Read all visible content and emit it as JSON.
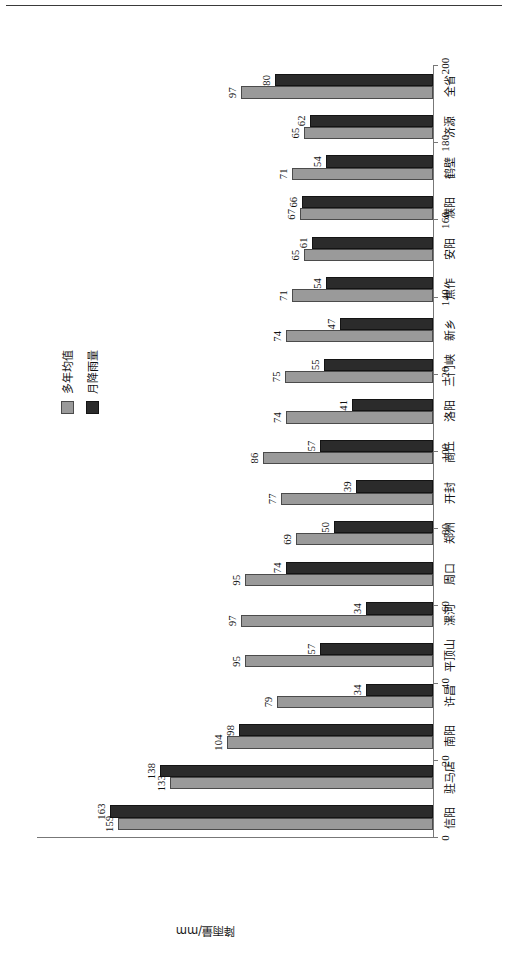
{
  "figure": {
    "y_axis_title": "降雨量/mm",
    "legend": {
      "position": "top-right-inside",
      "items": [
        {
          "label": "多年均值",
          "color": "#9a9a9a"
        },
        {
          "label": "月降雨量",
          "color": "#2b2b2b"
        }
      ]
    }
  },
  "chart_data": {
    "type": "bar",
    "title": "",
    "subtitle": "",
    "xlabel": "",
    "ylabel": "降雨量/mm",
    "ylim": [
      0,
      200
    ],
    "yticks": [
      0,
      20,
      40,
      60,
      80,
      100,
      120,
      140,
      160,
      180,
      200
    ],
    "ytick_labels": [
      "0",
      "20",
      "40",
      "60",
      "80",
      "100",
      "120",
      "140",
      "160",
      "180",
      "200"
    ],
    "grid": false,
    "orientation": "vertical-bars-rotated-90",
    "legend_position": "upper right",
    "categories": [
      "信阳",
      "驻马店",
      "南阳",
      "许昌",
      "平顶山",
      "漯河",
      "周口",
      "郑州",
      "开封",
      "商丘",
      "洛阳",
      "三门峡",
      "新乡",
      "焦作",
      "安阳",
      "濮阳",
      "鹤壁",
      "济源",
      "全省"
    ],
    "series": [
      {
        "name": "多年均值",
        "color": "#9a9a9a",
        "values": [
          159,
          133,
          104,
          79,
          95,
          97,
          95,
          69,
          77,
          86,
          74,
          75,
          74,
          71,
          65,
          67,
          71,
          65,
          97
        ]
      },
      {
        "name": "月降雨量",
        "color": "#2b2b2b",
        "values": [
          163,
          138,
          98,
          34,
          57,
          34,
          74,
          50,
          39,
          57,
          41,
          55,
          47,
          54,
          61,
          66,
          54,
          62,
          80
        ]
      }
    ],
    "data_labels": true
  }
}
